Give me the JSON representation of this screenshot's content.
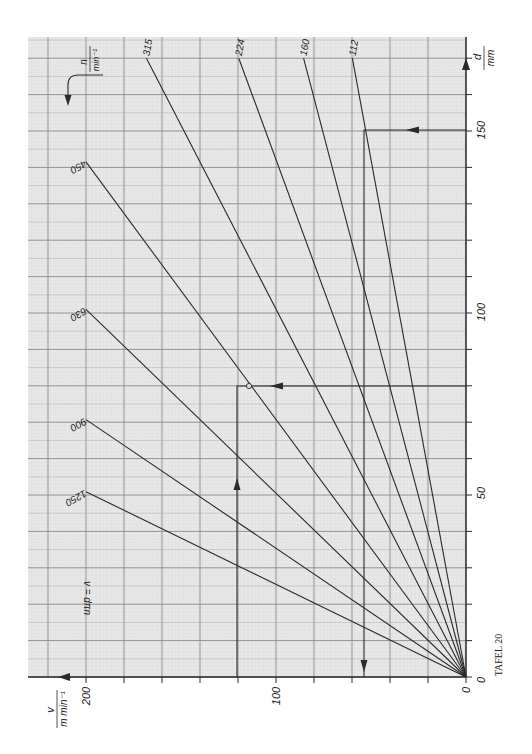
{
  "chart_data": {
    "type": "line",
    "title": "TAFEL 20",
    "formula": "v = dπn",
    "orientation": "rotated 90° clockwise: d axis vertical on right edge, v axis horizontal along bottom (increasing to the left)",
    "xlabel": "d / mm",
    "ylabel": "v / m min⁻¹",
    "series_label": "n / min⁻¹",
    "d_axis": {
      "label_num": "d",
      "label_den": "mm",
      "range": [
        0,
        175
      ],
      "ticks": [
        0,
        50,
        100,
        150
      ],
      "minor_tick_step": 10
    },
    "v_axis": {
      "label_num": "v",
      "label_den": "m min⁻¹",
      "range": [
        0,
        215
      ],
      "ticks": [
        0,
        100,
        200
      ],
      "minor_tick_step": 20
    },
    "grid": true,
    "series": [
      {
        "name": "1250",
        "n": 1250,
        "points": [
          [
            0,
            0
          ],
          [
            50.9,
            200
          ]
        ]
      },
      {
        "name": "900",
        "n": 900,
        "points": [
          [
            0,
            0
          ],
          [
            70.7,
            200
          ]
        ]
      },
      {
        "name": "630",
        "n": 630,
        "points": [
          [
            0,
            0
          ],
          [
            101.0,
            200
          ]
        ]
      },
      {
        "name": "450",
        "n": 450,
        "points": [
          [
            0,
            0
          ],
          [
            141.5,
            200
          ]
        ]
      },
      {
        "name": "315",
        "n": 315,
        "points": [
          [
            0,
            0
          ],
          [
            170,
            168.2
          ]
        ]
      },
      {
        "name": "224",
        "n": 224,
        "points": [
          [
            0,
            0
          ],
          [
            170,
            119.6
          ]
        ]
      },
      {
        "name": "160",
        "n": 160,
        "points": [
          [
            0,
            0
          ],
          [
            170,
            85.5
          ]
        ]
      },
      {
        "name": "112",
        "n": 112,
        "points": [
          [
            0,
            0
          ],
          [
            170,
            59.8
          ]
        ]
      }
    ],
    "annotations": [
      {
        "name": "example-1",
        "d": 80,
        "n": 450,
        "v": 113,
        "description": "From d=80 across to n=450 line (marked point), then to v≈113"
      },
      {
        "name": "example-2",
        "d": 150,
        "n": 112,
        "v": 52.8,
        "description": "From d=150 across to n=112 line, then down to v≈53"
      }
    ]
  },
  "labels": {
    "zero_d": "0",
    "zero_v": "0",
    "d50": "50",
    "d100": "100",
    "d150": "150",
    "v100": "100",
    "v200": "200",
    "d_num": "d",
    "d_den": "mm",
    "v_num": "v",
    "v_den": "m min⁻¹",
    "n_num": "n",
    "n_den": "min⁻¹",
    "formula": "v = dπn",
    "tafel": "TAFEL 20",
    "s1250": "1250",
    "s900": "900",
    "s630": "630",
    "s450": "450",
    "s315": "315",
    "s224": "224",
    "s160": "160",
    "s112": "112"
  },
  "colors": {
    "paper": "#e6e6e6",
    "grid_fine": "#c8c8c8",
    "grid_mid": "#a9a9a9",
    "grid_major": "#8a8a8a",
    "ink": "#2a2a2a"
  }
}
